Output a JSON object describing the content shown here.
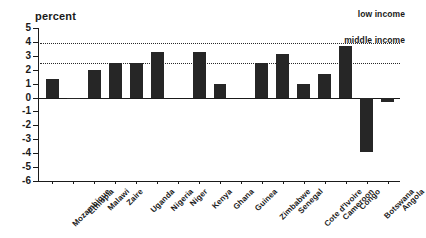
{
  "chart_data": {
    "type": "bar",
    "title": "",
    "ylabel": "percent",
    "xlabel": "",
    "ylim": [
      -6,
      5
    ],
    "yticks": [
      5,
      4,
      3,
      2,
      1,
      0,
      -1,
      -2,
      -3,
      -4,
      -5,
      -6
    ],
    "grid": false,
    "legend_position": "top-right",
    "categories": [
      "Mozambique",
      "Ethiopia",
      "Malawi",
      "Zaire",
      "Uganda",
      "Nigeria",
      "Niger",
      "Kenya",
      "Ghana",
      "Guinea",
      "Zimbabwe",
      "Senegal",
      "Cote d'Ivoire",
      "Cameroon",
      "Congo",
      "Botswana",
      "Angola"
    ],
    "values": [
      1.3,
      -0.1,
      2.0,
      2.5,
      2.5,
      3.3,
      0.0,
      3.3,
      1.0,
      0.0,
      2.5,
      3.1,
      1.0,
      1.7,
      3.7,
      -3.9,
      -0.3
    ],
    "reference_lines": [
      {
        "label": "low income",
        "value": 3.9
      },
      {
        "label": "middle income",
        "value": 2.5
      }
    ],
    "annotations": [
      "low income",
      "middle income"
    ],
    "colors": {
      "bar": "#262626",
      "axis": "#1a1a1a",
      "reference_line": "#2a2a2a",
      "background": "#ffffff"
    }
  }
}
